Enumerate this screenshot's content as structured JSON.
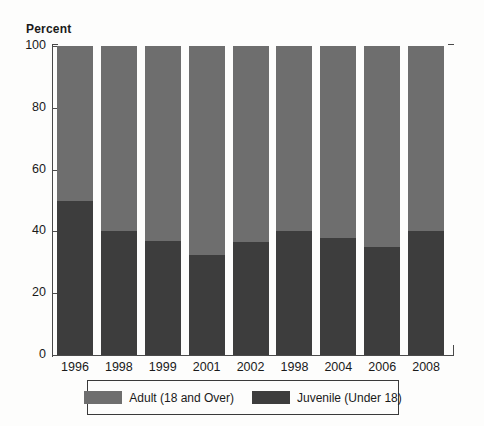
{
  "chart_data": {
    "type": "bar",
    "subtype": "stacked-100-percent",
    "title": "",
    "xlabel": "",
    "ylabel": "Percent",
    "ylim": [
      0,
      100
    ],
    "yticks": [
      0,
      20,
      40,
      60,
      80,
      100
    ],
    "grid": false,
    "legend_position": "bottom",
    "categories": [
      "1996",
      "1998",
      "1999",
      "2001",
      "2002",
      "1998",
      "2004",
      "2006",
      "2008"
    ],
    "series": [
      {
        "name": "Juvenile (Under 18)",
        "color": "#3d3d3d",
        "values": [
          50,
          40,
          37,
          32.5,
          36.5,
          40,
          38,
          35,
          40
        ]
      },
      {
        "name": "Adult (18 and Over)",
        "color": "#6e6e6e",
        "values": [
          50,
          60,
          63,
          67.5,
          63.5,
          60,
          62,
          65,
          60
        ]
      }
    ]
  },
  "axis": {
    "y_title": "Percent",
    "y_tick_labels": [
      "100",
      "80",
      "60",
      "40",
      "20",
      "0"
    ],
    "x_tick_labels": [
      "1996",
      "1998",
      "1999",
      "2001",
      "2002",
      "1998",
      "2004",
      "2006",
      "2008"
    ]
  },
  "legend": {
    "entries": [
      {
        "label": "Adult (18 and Over)",
        "color": "#6e6e6e"
      },
      {
        "label": "Juvenile (Under 18)",
        "color": "#3d3d3d"
      }
    ]
  },
  "colors": {
    "adult": "#6e6e6e",
    "juvenile": "#3d3d3d",
    "axis": "#4a4a4a",
    "background": "#fdfdfc",
    "text": "#1a1a1a"
  }
}
